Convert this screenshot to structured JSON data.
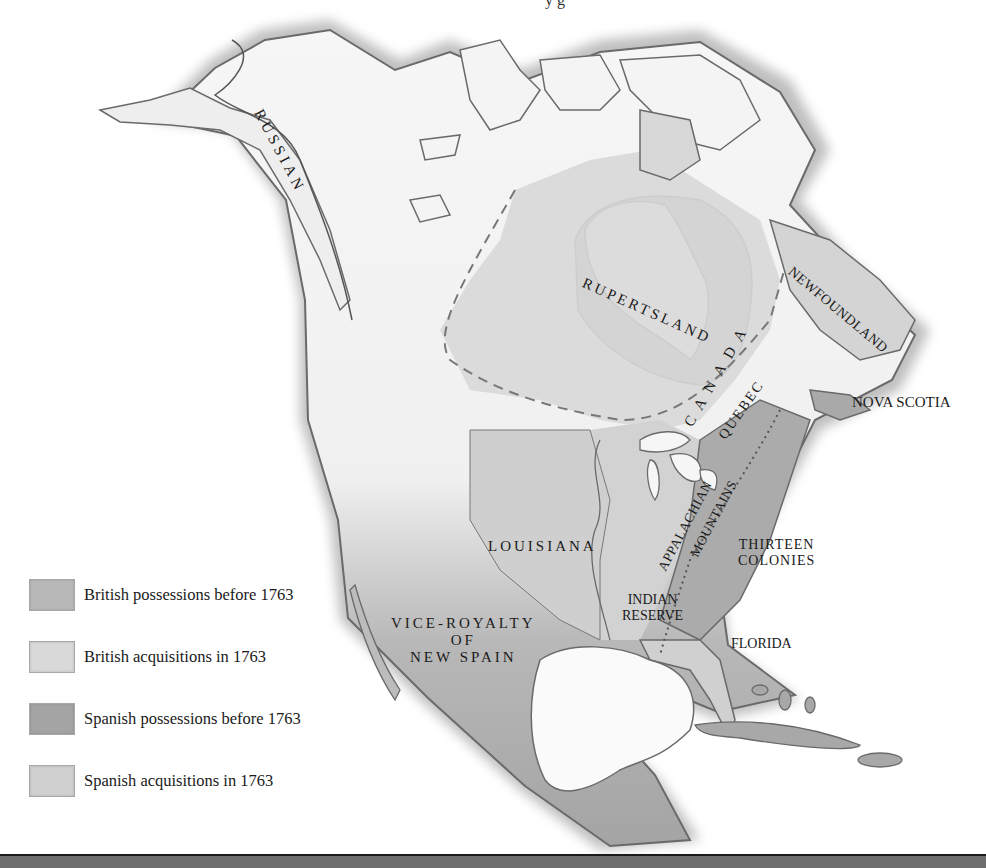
{
  "header": {
    "cut_off_title_fragment": "y g"
  },
  "map": {
    "title": "North America after 1763",
    "colors": {
      "british_before_1763": "#b9b9b9",
      "british_acquisitions_1763": "#d6d6d6",
      "spanish_before_1763": "#a4a4a4",
      "spanish_acquisitions_1763": "#cdcdcd",
      "unclaimed_land": "#f4f4f4",
      "water": "#ffffff",
      "coast_outline": "#6a6a6a",
      "bottom_bar": "#6e6e6e"
    },
    "labels": {
      "russian": "RUSSIAN",
      "rupertsland": "RUPERTSLAND",
      "newfoundland": "NEWFOUNDLAND",
      "canada": "CANADA",
      "quebec": "QUEBEC",
      "nova_scotia": "NOVA SCOTIA",
      "appalachian": "APPALACHIAN",
      "mountains": "MOUNTAINS",
      "louisiana": "LOUISIANA",
      "thirteen_colonies_line1": "THIRTEEN",
      "thirteen_colonies_line2": "COLONIES",
      "indian_reserve_line1": "INDIAN",
      "indian_reserve_line2": "RESERVE",
      "florida": "FLORIDA",
      "new_spain_line1": "VICE-ROYALTY",
      "new_spain_line2": "OF",
      "new_spain_line3": "NEW SPAIN"
    }
  },
  "legend": {
    "items": [
      {
        "label": "British possessions before 1763",
        "swatch": "#b9b9b9"
      },
      {
        "label": "British acquisitions in 1763",
        "swatch": "#d9d9d9"
      },
      {
        "label": "Spanish possessions before 1763",
        "swatch": "#a4a4a4"
      },
      {
        "label": "Spanish acquisitions in 1763",
        "swatch": "#d0d0d0"
      }
    ]
  }
}
